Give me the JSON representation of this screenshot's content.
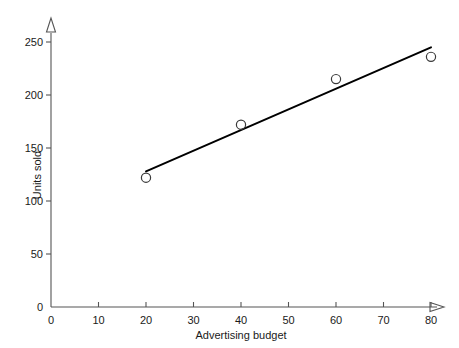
{
  "chart_data": {
    "type": "scatter",
    "title": "",
    "subtitle": "",
    "xlabel": "Advertising budget",
    "ylabel": "Units sold",
    "xlim": [
      0,
      80
    ],
    "ylim": [
      0,
      250
    ],
    "xticks": [
      0,
      10,
      20,
      30,
      40,
      50,
      60,
      70,
      80
    ],
    "yticks": [
      0,
      50,
      100,
      150,
      200,
      250
    ],
    "xtick_labels": [
      "0",
      "10",
      "20",
      "30",
      "40",
      "50",
      "60",
      "70",
      "80"
    ],
    "ytick_labels": [
      "0",
      "50",
      "100",
      "150",
      "200",
      "250"
    ],
    "grid": false,
    "legend": null,
    "series": [
      {
        "name": "Observations",
        "type": "scatter",
        "marker": "open-circle",
        "color": "#1a1a1a",
        "points": [
          {
            "x": 20,
            "y": 122
          },
          {
            "x": 40,
            "y": 172
          },
          {
            "x": 60,
            "y": 215
          },
          {
            "x": 80,
            "y": 236
          }
        ]
      },
      {
        "name": "Regression line",
        "type": "line",
        "color": "#000000",
        "points": [
          {
            "x": 20,
            "y": 128
          },
          {
            "x": 80,
            "y": 245
          }
        ]
      }
    ],
    "axis_style": {
      "x_axis_arrow": true,
      "y_axis_arrow": true,
      "arrow_style": "open-triangle",
      "axis_color": "#555555",
      "tick_direction": "out"
    }
  },
  "colors": {
    "background": "#ffffff",
    "axis": "#555555",
    "text": "#1a1a1a",
    "line": "#000000",
    "marker": "#3a3a3a"
  }
}
